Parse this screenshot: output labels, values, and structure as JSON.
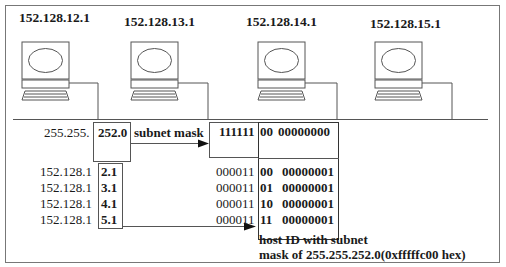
{
  "hosts": [
    {
      "ip": "152.128.12.1"
    },
    {
      "ip": "152.128.13.1"
    },
    {
      "ip": "152.128.14.1"
    },
    {
      "ip": "152.128.15.1"
    }
  ],
  "mask": {
    "prefix": "255.255.",
    "value": "252.0",
    "label": "subnet mask",
    "bits_network": "111111",
    "bits_subnet": "00",
    "bits_host": "00000000"
  },
  "addresses": [
    {
      "prefix": "152.128.1",
      "suffix": "2.1",
      "bits_net": "000011",
      "bits_sub": "00",
      "bits_host": "00000001"
    },
    {
      "prefix": "152.128.1",
      "suffix": "3.1",
      "bits_net": "000011",
      "bits_sub": "01",
      "bits_host": "00000001"
    },
    {
      "prefix": "152.128.1",
      "suffix": "4.1",
      "bits_net": "000011",
      "bits_sub": "10",
      "bits_host": "00000001"
    },
    {
      "prefix": "152.128.1",
      "suffix": "5.1",
      "bits_net": "000011",
      "bits_sub": "11",
      "bits_host": "00000001"
    }
  ],
  "caption": {
    "line1": "host ID with subnet",
    "line2": "mask of 255.255.252.0(0xfffffc00 hex)"
  }
}
